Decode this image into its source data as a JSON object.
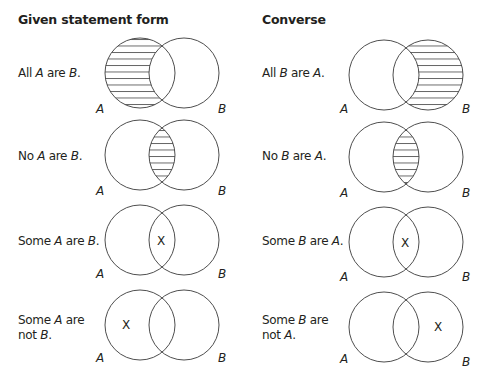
{
  "headings": {
    "given": "Given statement form",
    "converse": "Converse"
  },
  "rows": [
    {
      "given": {
        "pre": "All ",
        "v1": "A",
        "mid": " are ",
        "v2": "B",
        "post": ".",
        "shade": "A-only",
        "x": null
      },
      "converse": {
        "pre": "All ",
        "v1": "B",
        "mid": " are ",
        "v2": "A",
        "post": ".",
        "shade": "B-only",
        "x": null
      }
    },
    {
      "given": {
        "pre": "No ",
        "v1": "A",
        "mid": " are ",
        "v2": "B",
        "post": ".",
        "shade": "intersection",
        "x": null
      },
      "converse": {
        "pre": "No ",
        "v1": "B",
        "mid": " are ",
        "v2": "A",
        "post": ".",
        "shade": "intersection",
        "x": null
      }
    },
    {
      "given": {
        "pre": "Some ",
        "v1": "A",
        "mid": " are ",
        "v2": "B",
        "post": ".",
        "shade": null,
        "x": "intersection"
      },
      "converse": {
        "pre": "Some ",
        "v1": "B",
        "mid": " are ",
        "v2": "A",
        "post": ".",
        "shade": null,
        "x": "intersection"
      }
    },
    {
      "given": {
        "pre": "Some ",
        "v1": "A",
        "mid": " are",
        "line2pre": "not ",
        "v2": "B",
        "post": ".",
        "shade": null,
        "x": "A-only"
      },
      "converse": {
        "pre": "Some ",
        "v1": "B",
        "mid": " are",
        "line2pre": "not ",
        "v2": "A",
        "post": ".",
        "shade": null,
        "x": "B-only"
      }
    }
  ],
  "labels": {
    "a": "A",
    "b": "B",
    "x": "X"
  },
  "colors": {
    "stroke": "#3a3a3a",
    "text": "#231f20",
    "background": "#ffffff"
  }
}
